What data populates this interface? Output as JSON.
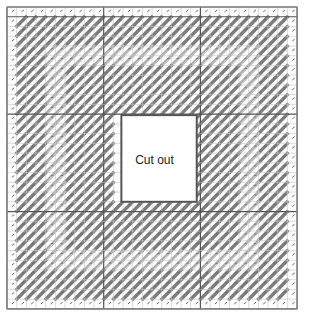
{
  "diagram": {
    "type": "stitch-chart",
    "cutout_label": "Cut out",
    "grid": {
      "origin_x": 7,
      "origin_y": 7,
      "cols": 30,
      "rows": 31,
      "cell_w": 9.67,
      "cell_h": 9.74,
      "major_every": 10,
      "minor_color": "#c4c4c4",
      "major_color": "#555555",
      "border_color": "#8a8a8a"
    },
    "cutout": {
      "col_start": 11,
      "col_end": 19,
      "row_start": 11,
      "row_end": 20,
      "border_color": "#555555"
    },
    "rings": [
      {
        "depth": 0,
        "style": "empty"
      },
      {
        "depth": 1,
        "style": "dark"
      },
      {
        "depth": 2,
        "style": "dark"
      },
      {
        "depth": 3,
        "style": "dark"
      },
      {
        "depth": 4,
        "style": "light"
      },
      {
        "depth": 5,
        "style": "light"
      },
      {
        "depth": 6,
        "style": "dark"
      },
      {
        "depth": 7,
        "style": "dark"
      },
      {
        "depth": 8,
        "style": "dark"
      },
      {
        "depth": 9,
        "style": "dark"
      },
      {
        "depth": 10,
        "style": "dark"
      }
    ],
    "colors": {
      "dark": "#7d7d7d",
      "light": "#ababab",
      "tick": "#6a6a6a"
    }
  }
}
